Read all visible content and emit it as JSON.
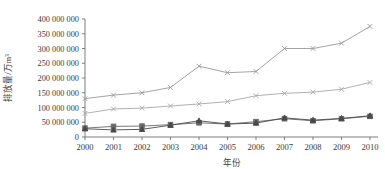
{
  "chart_data": {
    "type": "line",
    "title": "",
    "xlabel": "年份",
    "ylabel": "排放量/万m³",
    "x": [
      2000,
      2001,
      2002,
      2003,
      2004,
      2005,
      2006,
      2007,
      2008,
      2009,
      2010
    ],
    "xticklabels": [
      "2000",
      "2001",
      "2002",
      "2003",
      "2004",
      "2005",
      "2006",
      "2007",
      "2008",
      "2009",
      "2010"
    ],
    "yticklabels": [
      "0",
      "50 000 000",
      "100 000 000",
      "150 000 000",
      "200 000 000",
      "250 000 000",
      "300 000 000",
      "350 000 000",
      "400 000 000"
    ],
    "ytickvalues": [
      0,
      50000000,
      100000000,
      150000000,
      200000000,
      250000000,
      300000000,
      350000000,
      400000000
    ],
    "ylim": [
      0,
      400000000
    ],
    "xlim": [
      2000,
      2010
    ],
    "grid": false,
    "legend": "none",
    "series": [
      {
        "name": "series-1",
        "marker": "cross",
        "color": "#9a9a9a",
        "values": [
          130000000,
          142000000,
          150000000,
          168000000,
          240000000,
          218000000,
          222000000,
          300000000,
          300000000,
          318000000,
          375000000
        ]
      },
      {
        "name": "series-2",
        "marker": "cross",
        "color": "#a8a8a8",
        "values": [
          80000000,
          95000000,
          98000000,
          105000000,
          112000000,
          120000000,
          140000000,
          148000000,
          152000000,
          162000000,
          185000000
        ]
      },
      {
        "name": "series-3",
        "marker": "square",
        "color": "#6a6a6a",
        "values": [
          30000000,
          36000000,
          37000000,
          42000000,
          48000000,
          44000000,
          52000000,
          62000000,
          55000000,
          62000000,
          70000000
        ]
      },
      {
        "name": "series-4",
        "marker": "triangle",
        "color": "#4a4a4a",
        "values": [
          28000000,
          24000000,
          26000000,
          40000000,
          55000000,
          44000000,
          47000000,
          65000000,
          57000000,
          63000000,
          72000000
        ]
      }
    ]
  },
  "axes": {
    "y_title": "排放量/万m³",
    "x_title": "年份"
  }
}
